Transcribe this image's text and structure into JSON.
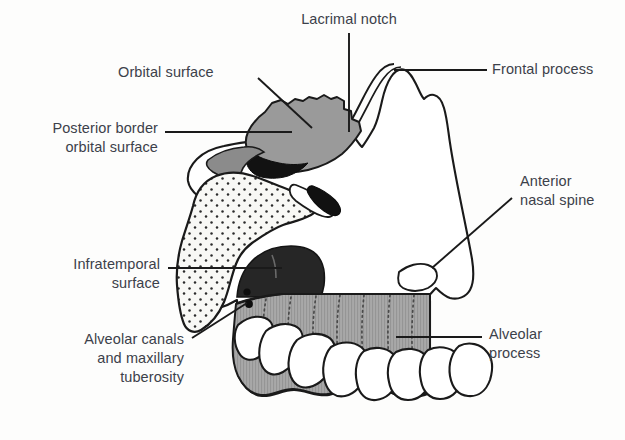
{
  "diagram": {
    "background_color": "#fdfdfc",
    "outline_color": "#1a1a1a",
    "label_text_color": "#3c414a",
    "leader_line_color": "#1a1a1a"
  },
  "palette": {
    "orbital_surface_fill": "#9a9a9a",
    "posterior_border_fill": "#8b8b8b",
    "zygomatic_stipple_fill": "#f7f7f4",
    "stipple_dot_color": "#2b2b2b",
    "infratemporal_fill": "#262626",
    "alveolar_process_fill": "#a8a8a8",
    "alveolar_hatch_color": "#555555",
    "tooth_fill": "#ffffff",
    "bone_body_fill": "#ffffff",
    "black_spur_fill": "#111111"
  },
  "labels": [
    {
      "id": "orbital-surface",
      "text": "Orbital surface",
      "align": "left",
      "x": 118,
      "y": 63,
      "width": 150,
      "leader": {
        "type": "diagonal",
        "x1": 258,
        "y1": 78,
        "x2": 312,
        "y2": 128
      }
    },
    {
      "id": "lacrimal-notch",
      "text": "Lacrimal notch",
      "align": "center",
      "x": 282,
      "y": 10,
      "width": 134,
      "leader": {
        "type": "vertical",
        "x1": 349,
        "y1": 33,
        "x2": 349,
        "y2": 132
      }
    },
    {
      "id": "frontal-process",
      "text": "Frontal process",
      "align": "left",
      "x": 492,
      "y": 60,
      "width": 130,
      "leader": {
        "type": "horizontal",
        "x1": 394,
        "y1": 70,
        "x2": 487,
        "y2": 70
      }
    },
    {
      "id": "posterior-border-orbital-surface",
      "text": "Posterior border\norbital surface",
      "align": "right",
      "x": 18,
      "y": 119,
      "width": 140,
      "leader": {
        "type": "horizontal",
        "x1": 165,
        "y1": 132,
        "x2": 292,
        "y2": 132
      }
    },
    {
      "id": "anterior-nasal-spine",
      "text": "Anterior\nnasal spine",
      "align": "left",
      "x": 520,
      "y": 172,
      "width": 100,
      "leader": {
        "type": "diagonal",
        "x1": 432,
        "y1": 268,
        "x2": 512,
        "y2": 198
      }
    },
    {
      "id": "infratemporal-surface",
      "text": "Infratemporal\nsurface",
      "align": "right",
      "x": 38,
      "y": 255,
      "width": 122,
      "leader": {
        "type": "horizontal",
        "x1": 168,
        "y1": 268,
        "x2": 282,
        "y2": 268
      }
    },
    {
      "id": "alveolar-canals-maxillary-tuberosity",
      "text": "Alveolar canals\nand maxillary\ntuberosity",
      "align": "right",
      "x": 36,
      "y": 330,
      "width": 148,
      "leader": {
        "type": "diagonal",
        "x1": 192,
        "y1": 338,
        "x2": 247,
        "y2": 303
      }
    },
    {
      "id": "alveolar-process",
      "text": "Alveolar\nprocess",
      "align": "left",
      "x": 489,
      "y": 325,
      "width": 100,
      "leader": {
        "type": "horizontal",
        "x1": 396,
        "y1": 337,
        "x2": 482,
        "y2": 337
      }
    }
  ],
  "anatomy": {
    "regions": [
      {
        "id": "orbital-surface-region",
        "name": "Orbital surface",
        "shading": "mid-gray"
      },
      {
        "id": "posterior-border-region",
        "name": "Posterior border of orbital surface",
        "shading": "dark-gray-wedge"
      },
      {
        "id": "zygomatic-stipple-region",
        "name": "Zygomatic process (stippled)",
        "shading": "stippled"
      },
      {
        "id": "infratemporal-region",
        "name": "Infratemporal surface",
        "shading": "near-black"
      },
      {
        "id": "alveolar-process-region",
        "name": "Alveolar process",
        "shading": "hatched-gray"
      },
      {
        "id": "frontal-process-region",
        "name": "Frontal process",
        "shading": "white"
      },
      {
        "id": "anterior-nasal-spine-region",
        "name": "Anterior nasal spine",
        "shading": "white"
      }
    ],
    "alveolar_canal_dots": [
      {
        "cx": 247,
        "cy": 292,
        "r": 3.6
      },
      {
        "cx": 249,
        "cy": 304,
        "r": 3.9
      }
    ],
    "teeth_count": 8
  }
}
